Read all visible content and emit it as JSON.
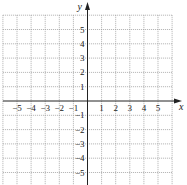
{
  "chart_data": {
    "type": "scatter",
    "title": "",
    "xlabel": "x",
    "ylabel": "y",
    "xlim": [
      -6,
      6
    ],
    "ylim": [
      -6,
      6
    ],
    "grid": true,
    "grid_style": "dotted",
    "x_ticks": [
      -5,
      -4,
      -3,
      -2,
      -1,
      1,
      2,
      3,
      4,
      5
    ],
    "y_ticks": [
      -5,
      -4,
      -3,
      -2,
      -1,
      1,
      2,
      3,
      4,
      5
    ],
    "x_tick_labels": [
      "−5",
      "−4",
      "−3",
      "−2",
      "−1",
      "1",
      "2",
      "3",
      "4",
      "5"
    ],
    "y_tick_labels": [
      "−5",
      "−4",
      "−3",
      "−2",
      "−1",
      "1",
      "2",
      "3",
      "4",
      "5"
    ],
    "series": [],
    "legend": null
  },
  "colors": {
    "axis": "#222222",
    "grid": "#9a9a9a",
    "text": "#222222",
    "background": "#ffffff"
  }
}
